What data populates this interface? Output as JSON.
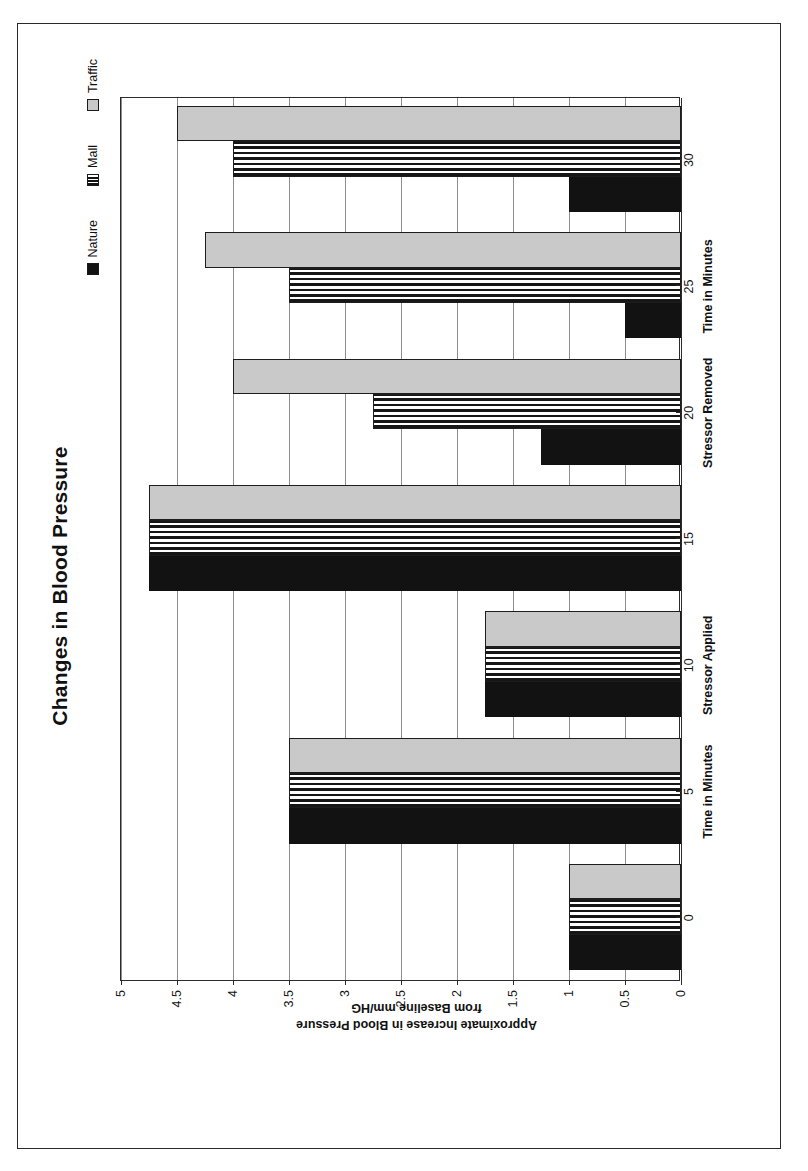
{
  "chart_data": {
    "type": "bar",
    "orientation": "vertical-rendered-rotated",
    "title": "Changes in Blood Pressure",
    "xlabel": "Time in Minutes",
    "ylabel_lines": [
      "Approximate Increase in Blood Pressure",
      "from Baseline mm/HG"
    ],
    "categories": [
      "0",
      "5",
      "10",
      "15",
      "20",
      "25",
      "30"
    ],
    "ylim": [
      0,
      5
    ],
    "yticks": [
      "0",
      "0.5",
      "1",
      "1.5",
      "2",
      "2.5",
      "3",
      "3.5",
      "4",
      "4.5",
      "5"
    ],
    "grid": true,
    "legend_position": "top-right",
    "series": [
      {
        "name": "Nature",
        "pattern": "solid-black",
        "color": "#121212",
        "values": [
          1,
          3.5,
          1.75,
          4.75,
          1.25,
          0.5,
          1
        ]
      },
      {
        "name": "Mall",
        "pattern": "vertical-stripes",
        "color": "#161616",
        "values": [
          1,
          3.5,
          1.75,
          4.75,
          2.75,
          3.5,
          4
        ]
      },
      {
        "name": "Traffic",
        "pattern": "light-gray",
        "color": "#c9c9c9",
        "values": [
          1,
          3.5,
          1.75,
          4.75,
          4,
          4.25,
          4.5
        ]
      }
    ],
    "annotations": [
      {
        "text": "Time in Minutes",
        "at_category": "5"
      },
      {
        "text": "Stressor Applied",
        "at_category": "10"
      },
      {
        "text": "Stressor Removed",
        "at_category": "20"
      },
      {
        "text": "Time in Minutes",
        "at_category": "25"
      }
    ]
  },
  "legend": {
    "items": [
      {
        "label": "Nature",
        "swatch": "nature-swatch-icon"
      },
      {
        "label": "Mall",
        "swatch": "mall-swatch-icon"
      },
      {
        "label": "Traffic",
        "swatch": "traffic-swatch-icon"
      }
    ]
  }
}
